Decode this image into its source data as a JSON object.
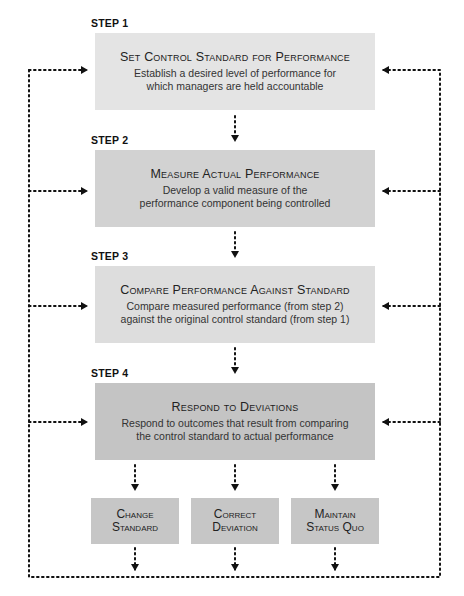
{
  "steps": [
    {
      "label": "STEP 1",
      "title": "Set Control Standard for Performance",
      "description": "Establish a desired level of performance for which managers are held accountable",
      "color": "#e4e4e4"
    },
    {
      "label": "STEP 2",
      "title": "Measure Actual Performance",
      "description": "Develop a valid measure of the performance component being controlled",
      "color": "#d2d2d2"
    },
    {
      "label": "STEP 3",
      "title": "Compare Performance Against Standard",
      "description": "Compare measured performance (from step 2) against the original control standard (from step 1)",
      "color": "#dddddd"
    },
    {
      "label": "STEP 4",
      "title": "Respond to Deviations",
      "description": "Respond to outcomes that result from comparing the control standard to actual performance",
      "color": "#c4c4c4"
    }
  ],
  "responses": [
    {
      "line1": "Change",
      "line2": "Standard"
    },
    {
      "line1": "Correct",
      "line2": "Deviation"
    },
    {
      "line1": "Maintain",
      "line2": "Status Quo"
    }
  ]
}
